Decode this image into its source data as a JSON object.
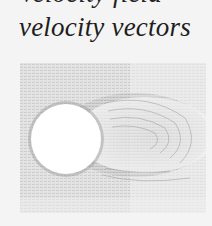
{
  "document": {
    "caption_partial_line": "Velocity field",
    "caption": "velocity vectors"
  },
  "figure": {
    "background_color": "#eeeeee",
    "cylinder_color": "#ffffff",
    "vector_color": "#8a8a8a"
  }
}
